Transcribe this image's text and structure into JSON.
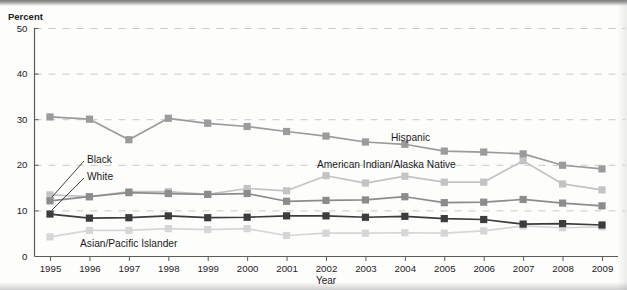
{
  "figure": {
    "ylabel": "Percent",
    "xlabel": "Year"
  },
  "chart_data": {
    "type": "line",
    "title": "",
    "xlabel": "Year",
    "ylabel": "Percent",
    "ylim": [
      0,
      50
    ],
    "yticks": [
      0,
      10,
      20,
      30,
      40,
      50
    ],
    "grid": true,
    "legend_position": "inline-annotations",
    "categories": [
      "1995",
      "1996",
      "1997",
      "1998",
      "1999",
      "2000",
      "2001",
      "2002",
      "2003",
      "2004",
      "2005",
      "2006",
      "2007",
      "2008",
      "2009"
    ],
    "x": [
      1995,
      1996,
      1997,
      1998,
      1999,
      2000,
      2001,
      2002,
      2003,
      2004,
      2005,
      2006,
      2007,
      2008,
      2009
    ],
    "series": [
      {
        "name": "Hispanic",
        "color": "#9b9b9b",
        "marker": "square",
        "values": [
          30.5,
          30.0,
          25.5,
          30.2,
          29.1,
          28.4,
          27.3,
          26.3,
          25.0,
          24.5,
          23.0,
          22.8,
          22.4,
          19.9,
          19.1
        ]
      },
      {
        "name": "American Indian/Alaska Native",
        "color": "#c3c3c3",
        "marker": "square",
        "values": [
          13.4,
          13.0,
          14.1,
          14.1,
          13.5,
          14.8,
          14.3,
          17.6,
          16.0,
          17.5,
          16.2,
          16.2,
          20.9,
          15.8,
          14.5
        ]
      },
      {
        "name": "White",
        "color": "#8c8c8c",
        "marker": "square",
        "values": [
          12.1,
          13.0,
          13.9,
          13.7,
          13.5,
          13.7,
          12.0,
          12.2,
          12.3,
          13.0,
          11.7,
          11.8,
          12.4,
          11.6,
          11.0
        ]
      },
      {
        "name": "Black",
        "color": "#3c3c3c",
        "marker": "square",
        "values": [
          9.2,
          8.3,
          8.4,
          8.8,
          8.4,
          8.5,
          8.8,
          8.8,
          8.5,
          8.7,
          8.2,
          8.0,
          7.0,
          7.1,
          6.8
        ]
      },
      {
        "name": "Asian/Pacific Islander",
        "color": "#d6d6d6",
        "marker": "square",
        "values": [
          4.2,
          5.6,
          5.6,
          6.0,
          5.8,
          6.0,
          4.5,
          5.0,
          5.0,
          5.1,
          5.0,
          5.5,
          6.6,
          6.2,
          6.4
        ]
      }
    ],
    "annotations": [
      {
        "text": "Hispanic",
        "series": "Hispanic",
        "x": 391,
        "y": 141
      },
      {
        "text": "American Indian/Alaska Native",
        "series": "American Indian/Alaska Native",
        "x": 317,
        "y": 168
      },
      {
        "text": "Black",
        "series": "Black",
        "x": 87,
        "y": 163
      },
      {
        "text": "White",
        "series": "White",
        "x": 87,
        "y": 180
      },
      {
        "text": "Asian/Pacific Islander",
        "series": "Asian/Pacific Islander",
        "x": 80,
        "y": 247
      }
    ]
  }
}
